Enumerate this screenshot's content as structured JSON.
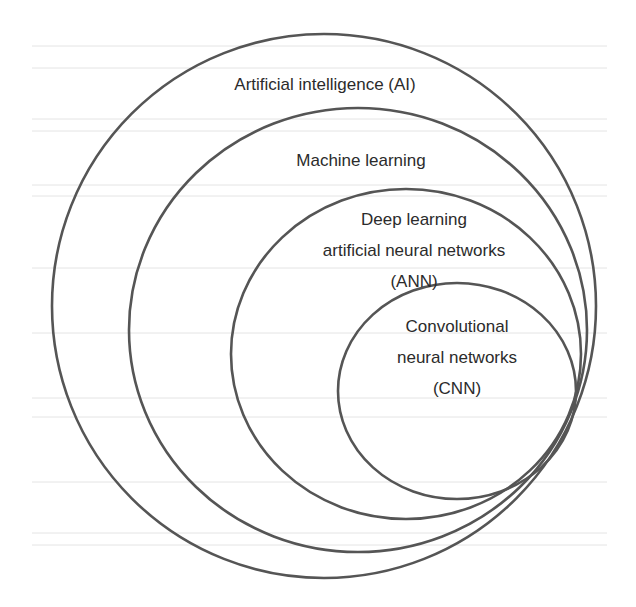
{
  "diagram": {
    "type": "nested-sets",
    "title": "",
    "stroke_color": "#555555",
    "text_color": "#2b2b2b",
    "background_color": "#ffffff",
    "sets": [
      {
        "id": "ai",
        "lines": [
          "Artificial intelligence (AI)"
        ],
        "cx": 324,
        "cy": 306,
        "rx": 272,
        "ry": 272
      },
      {
        "id": "ml",
        "lines": [
          "Machine learning"
        ],
        "cx": 358,
        "cy": 330,
        "rx": 229,
        "ry": 222
      },
      {
        "id": "dl",
        "lines": [
          "Deep learning",
          "artificial neural networks",
          "(ANN)"
        ],
        "cx": 406,
        "cy": 354,
        "rx": 175,
        "ry": 165
      },
      {
        "id": "cnn",
        "lines": [
          "Convolutional",
          "neural networks",
          "(CNN)"
        ],
        "cx": 457,
        "cy": 391,
        "rx": 119,
        "ry": 108
      }
    ],
    "relationship": "CNN ⊂ Deep learning (ANN) ⊂ Machine learning ⊂ Artificial intelligence"
  }
}
